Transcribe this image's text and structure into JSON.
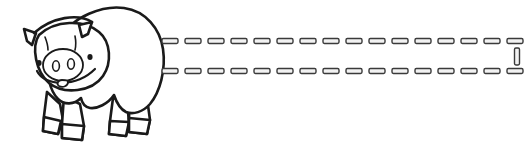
{
  "document": {
    "title": "Pig line drawing with dashed banner",
    "kind": "coloring-book line art",
    "width": 529,
    "height": 152,
    "background_color": "#ffffff",
    "caption": ""
  },
  "palette": {
    "ink": "#1a1a1a",
    "dash_stroke": "#3a3a3a",
    "dash_fill": "#f2f2f2",
    "paper": "#ffffff"
  },
  "figure": {
    "name": "pig",
    "facing": "left",
    "outline_color": "#1a1a1a",
    "fill_color": "#ffffff",
    "stroke_width": 2.6,
    "parts": [
      {
        "name": "body",
        "label": "Body"
      },
      {
        "name": "head",
        "label": "Head"
      },
      {
        "name": "ear-left",
        "label": "Left ear"
      },
      {
        "name": "ear-right",
        "label": "Right ear"
      },
      {
        "name": "eye-left",
        "label": "Left eye"
      },
      {
        "name": "eye-right",
        "label": "Right eye"
      },
      {
        "name": "snout",
        "label": "Snout"
      },
      {
        "name": "nostril-left",
        "label": "Left nostril"
      },
      {
        "name": "nostril-right",
        "label": "Right nostril"
      },
      {
        "name": "mouth",
        "label": "Mouth"
      },
      {
        "name": "tongue",
        "label": "Tongue"
      },
      {
        "name": "foreleg-front",
        "label": "Front foreleg"
      },
      {
        "name": "foreleg-back",
        "label": "Back foreleg"
      },
      {
        "name": "hindleg-front",
        "label": "Front hind leg"
      },
      {
        "name": "hindleg-back",
        "label": "Back hind leg"
      },
      {
        "name": "hoof-1",
        "label": "Hoof one"
      },
      {
        "name": "hoof-2",
        "label": "Hoof two"
      },
      {
        "name": "hoof-3",
        "label": "Hoof three"
      },
      {
        "name": "hoof-4",
        "label": "Hoof four"
      }
    ]
  },
  "dashed_banner": {
    "name": "dashed-banner",
    "description": "Open dashed rectangle extending right from the pig",
    "stroke_color": "#3a3a3a",
    "fill_color": "#f2f2f2",
    "dash_length": 16,
    "dash_gap": 7,
    "dash_thickness": 5,
    "lines": [
      {
        "name": "top-rule",
        "orientation": "horizontal",
        "x1": 162,
        "x2": 524,
        "y": 41,
        "dash_count": 16
      },
      {
        "name": "bottom-rule",
        "orientation": "horizontal",
        "x1": 162,
        "x2": 524,
        "y": 71,
        "dash_count": 16
      },
      {
        "name": "right-cap",
        "orientation": "vertical",
        "x": 517,
        "y1": 48,
        "y2": 65,
        "dash_count": 1
      }
    ]
  }
}
